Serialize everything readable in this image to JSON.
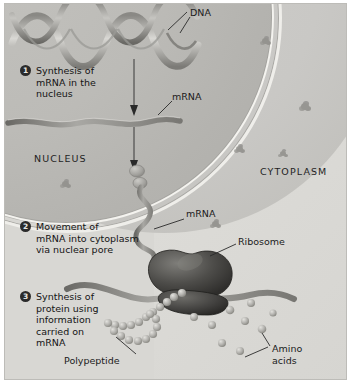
{
  "figure": {
    "background_color": "#d8d7d3",
    "ink_color": "#1b1b1b"
  },
  "compartments": [
    {
      "name": "nucleus",
      "label": "NUCLEUS"
    },
    {
      "name": "cytoplasm",
      "label": "CYTOPLASM"
    }
  ],
  "steps": [
    {
      "number": "1",
      "text": "Synthesis of\nmRNA in the\nnucleus"
    },
    {
      "number": "2",
      "text": "Movement of\nmRNA into cytoplasm\nvia nuclear pore"
    },
    {
      "number": "3",
      "text": "Synthesis of\nprotein using\ninformation\ncarried on\nmRNA"
    }
  ],
  "labels": {
    "dna": "DNA",
    "mrna_nucleus": "mRNA",
    "mrna_cytoplasm": "mRNA",
    "ribosome": "Ribosome",
    "polypeptide": "Polypeptide",
    "amino_acids": "Amino\nacids"
  },
  "structures": {
    "dna_helix": "double-helix-ribbon",
    "nuclear_envelope": "double-membrane-arc",
    "nuclear_pore": "pore-pair",
    "ribosome": "two-subunit-organelle",
    "polypeptide": "beaded-chain",
    "amino_acids": "free-spheres"
  }
}
